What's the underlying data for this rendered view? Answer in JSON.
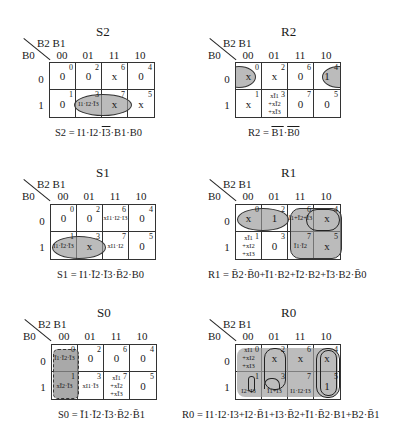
{
  "axis": {
    "col_vars": "B2 B1",
    "row_var": "B0",
    "col_codes": [
      "00",
      "01",
      "11",
      "10"
    ],
    "row_codes": [
      "0",
      "1"
    ]
  },
  "maps": {
    "S2": {
      "title": "S2",
      "cells": {
        "r0": [
          {
            "idx": "0",
            "val": "0"
          },
          {
            "idx": "2",
            "val": "0"
          },
          {
            "idx": "6",
            "val": "x"
          },
          {
            "idx": "4",
            "val": "0"
          }
        ],
        "r1": [
          {
            "idx": "1",
            "val": "0"
          },
          {
            "idx": "3",
            "val": "I1·I2·Ī3"
          },
          {
            "idx": "7",
            "val": "x"
          },
          {
            "idx": "5",
            "val": "x"
          }
        ]
      },
      "equation_lhs": "S2 = I1·I2·",
      "equation_ov1": "I3",
      "equation_rest": "·B1·B0"
    },
    "R2": {
      "title": "R2",
      "cells": {
        "r0": [
          {
            "idx": "0",
            "val": "x"
          },
          {
            "idx": "2",
            "val": "x"
          },
          {
            "idx": "6",
            "val": "0"
          },
          {
            "idx": "4",
            "val": "1"
          }
        ],
        "r1": [
          {
            "idx": "1",
            "val": "x"
          },
          {
            "idx": "3",
            "val": "xĪ1\n+xĪ2\n+xĪ3"
          },
          {
            "idx": "7",
            "val": "0"
          },
          {
            "idx": "5",
            "val": "0"
          }
        ]
      },
      "equation_lhs": "R2 = ",
      "equation_ov1": "B1",
      "equation_mid": "·",
      "equation_ov2": "B0"
    },
    "S1": {
      "title": "S1",
      "cells": {
        "r0": [
          {
            "idx": "0",
            "val": "0"
          },
          {
            "idx": "2",
            "val": "0"
          },
          {
            "idx": "6",
            "val": "xI1·I2·I3"
          },
          {
            "idx": "4",
            "val": "0"
          }
        ],
        "r1": [
          {
            "idx": "1",
            "val": "I1·Ī2·Ī3"
          },
          {
            "idx": "3",
            "val": "x"
          },
          {
            "idx": "7",
            "val": "xI1·I2"
          },
          {
            "idx": "5",
            "val": "0"
          }
        ]
      },
      "equation": "S1 = I1·Ī2·Ī3·B̄2·B0"
    },
    "R1": {
      "title": "R1",
      "cells": {
        "r0": [
          {
            "idx": "0",
            "val": "x"
          },
          {
            "idx": "2",
            "val": "1"
          },
          {
            "idx": "6",
            "val": "Ī1+Ī2+Ī3"
          },
          {
            "idx": "4",
            "val": "x"
          }
        ],
        "r1": [
          {
            "idx": "1",
            "val": "xĪ1\n+xI2\n+xI3"
          },
          {
            "idx": "3",
            "val": "0"
          },
          {
            "idx": "7",
            "val": "Ī1·Ī2"
          },
          {
            "idx": "5",
            "val": "x"
          }
        ]
      },
      "equation": "R1 = B̄2·B̄0+Ī1·B2+Ī2·B2+Ī3·B2·B̄0"
    },
    "S0": {
      "title": "S0",
      "cells": {
        "r0": [
          {
            "idx": "0",
            "val": "Ī1·Ī2·Ī3"
          },
          {
            "idx": "2",
            "val": "0"
          },
          {
            "idx": "6",
            "val": "0"
          },
          {
            "idx": "4",
            "val": "0"
          }
        ],
        "r1": [
          {
            "idx": "1",
            "val": "xĪ2·Ī3"
          },
          {
            "idx": "3",
            "val": "xI1·Ī3"
          },
          {
            "idx": "7",
            "val": "xĪ1\n+xĪ2\n+xĪ3"
          },
          {
            "idx": "5",
            "val": "0"
          }
        ]
      },
      "equation": "S0 = Ī1·Ī2·Ī3·B̄2·B̄1"
    },
    "R0": {
      "title": "R0",
      "cells": {
        "r0": [
          {
            "idx": "0",
            "val": "xI1\n+xI2\n+xI3"
          },
          {
            "idx": "2",
            "val": "x"
          },
          {
            "idx": "6",
            "val": "x"
          },
          {
            "idx": "4",
            "val": "x"
          }
        ],
        "r1": [
          {
            "idx": "1",
            "val": "I2+I3"
          },
          {
            "idx": "3",
            "val": "Ī1+I3"
          },
          {
            "idx": "7",
            "val": "I1·I2·I3"
          },
          {
            "idx": "5",
            "val": "1"
          }
        ]
      },
      "equation": "R0 = I1·I2·I3+I2·B̄1+I3·B̄2+Ī1·B̄2·B1+B2·B̄1"
    }
  }
}
